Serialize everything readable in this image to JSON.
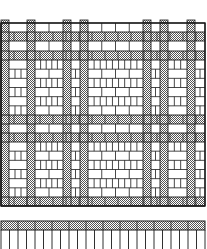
{
  "figure": {
    "kind": "brick paving pattern — plan and elevation engraving",
    "colors": {
      "ink": "#1a1a1a",
      "paper": "#ffffff",
      "hatch": "#8a8a8a"
    },
    "plan": {
      "x": 1,
      "y": 23,
      "w": 204,
      "h": 183,
      "h_bands": [
        [
          32,
          41
        ],
        [
          51,
          60
        ],
        [
          115,
          124
        ],
        [
          133,
          142
        ],
        [
          197,
          206
        ]
      ],
      "v_bands": [
        [
          1,
          9
        ],
        [
          27,
          35
        ],
        [
          63,
          71
        ],
        [
          80,
          88
        ],
        [
          143,
          151
        ],
        [
          160,
          168
        ],
        [
          187,
          195
        ]
      ],
      "top_tabs": [
        [
          1,
          9
        ],
        [
          27,
          35
        ],
        [
          63,
          71
        ],
        [
          80,
          88
        ],
        [
          143,
          151
        ],
        [
          160,
          168
        ],
        [
          187,
          195
        ]
      ]
    },
    "elevation": {
      "x": 1,
      "y": 221,
      "w": 204,
      "band_h": 9,
      "bottom": 249,
      "post_count": 24
    }
  }
}
